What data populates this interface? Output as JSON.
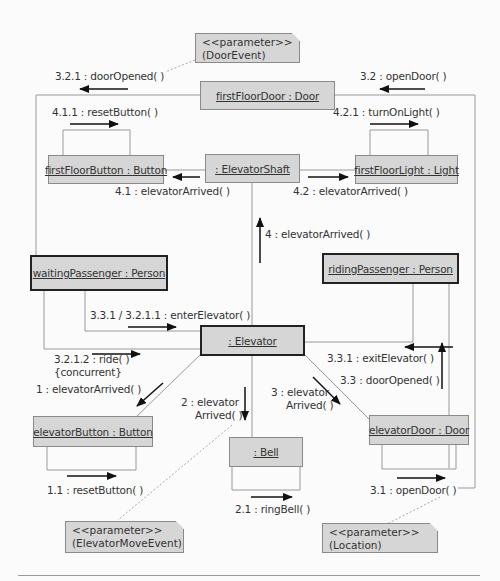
{
  "diagram": {
    "type": "UML collaboration diagram",
    "objects": [
      {
        "id": "firstFloorDoor",
        "label": "firstFloorDoor : Door"
      },
      {
        "id": "firstFloorButton",
        "label": "firstFloorButton : Button"
      },
      {
        "id": "elevatorShaft",
        "label": ": ElevatorShaft"
      },
      {
        "id": "firstFloorLight",
        "label": "firstFloorLight : Light"
      },
      {
        "id": "waitingPassenger",
        "label": "waitingPassenger : Person"
      },
      {
        "id": "ridingPassenger",
        "label": "ridingPassenger : Person"
      },
      {
        "id": "elevator",
        "label": ": Elevator"
      },
      {
        "id": "elevatorButton",
        "label": "elevatorButton : Button"
      },
      {
        "id": "bell",
        "label": ": Bell"
      },
      {
        "id": "elevatorDoor",
        "label": "elevatorDoor : Door"
      }
    ],
    "notes": [
      {
        "id": "doorEvent",
        "stereotype": "<<parameter>>",
        "text": "(DoorEvent)"
      },
      {
        "id": "elevatorMoveEvent",
        "stereotype": "<<parameter>>",
        "text": "(ElevatorMoveEvent)"
      },
      {
        "id": "location",
        "stereotype": "<<parameter>>",
        "text": "(Location)"
      }
    ],
    "messages": [
      {
        "id": "m321",
        "text": "3.2.1 : doorOpened( )"
      },
      {
        "id": "m32",
        "text": "3.2 : openDoor( )"
      },
      {
        "id": "m411",
        "text": "4.1.1 : resetButton( )"
      },
      {
        "id": "m421",
        "text": "4.2.1 : turnOnLight( )"
      },
      {
        "id": "m41",
        "text": "4.1 : elevatorArrived( )"
      },
      {
        "id": "m42",
        "text": "4.2 : elevatorArrived( )"
      },
      {
        "id": "m4",
        "text": "4 : elevatorArrived( )"
      },
      {
        "id": "m331_3211",
        "text": "3.3.1 / 3.2.1.1 : enterElevator( )"
      },
      {
        "id": "m3212",
        "text": "3.2.1.2 : ride( )"
      },
      {
        "id": "m3212c",
        "text": "{concurrent}"
      },
      {
        "id": "m1",
        "text": "1 : elevatorArrived( )"
      },
      {
        "id": "m2a",
        "text": "2 : elevator"
      },
      {
        "id": "m2b",
        "text": "Arrived( )"
      },
      {
        "id": "m3a",
        "text": "3 : elevator"
      },
      {
        "id": "m3b",
        "text": "Arrived( )"
      },
      {
        "id": "m331",
        "text": "3.3.1 : exitElevator( )"
      },
      {
        "id": "m33",
        "text": "3.3 : doorOpened( )"
      },
      {
        "id": "m11",
        "text": "1.1 : resetButton( )"
      },
      {
        "id": "m21",
        "text": "2.1 : ringBell( )"
      },
      {
        "id": "m31",
        "text": "3.1 : openDoor( )"
      }
    ]
  }
}
